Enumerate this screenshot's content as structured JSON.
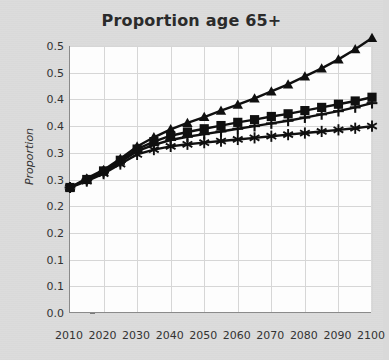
{
  "chart_data": {
    "type": "line",
    "title": "Proportion age 65+",
    "xlabel": "",
    "ylabel": "Proportion",
    "xlim": [
      2010,
      2100
    ],
    "ylim": [
      0.0,
      0.5
    ],
    "grid": true,
    "legend": "none",
    "x": [
      2010,
      2015,
      2020,
      2025,
      2030,
      2035,
      2040,
      2045,
      2050,
      2055,
      2060,
      2065,
      2070,
      2075,
      2080,
      2085,
      2090,
      2095,
      2100
    ],
    "x_tick_labels": [
      "2010",
      "2020",
      "2030",
      "2040",
      "2050",
      "2060",
      "2070",
      "2080",
      "2090",
      "2100"
    ],
    "x_tick_values": [
      2010,
      2020,
      2030,
      2040,
      2050,
      2060,
      2070,
      2080,
      2090,
      2100
    ],
    "y_tick_labels": [
      "0.5",
      "0.5",
      "0.4",
      "0.4",
      "0.3",
      "0.3",
      "0.2",
      "0.2",
      "0.1",
      "0.1",
      "0.0"
    ],
    "y_tick_values": [
      0.5,
      0.45,
      0.4,
      0.35,
      0.3,
      0.25,
      0.2,
      0.15,
      0.1,
      0.05,
      0.0
    ],
    "series": [
      {
        "name": "series-triangle",
        "marker": "triangle",
        "color": "#101010",
        "values": [
          0.235,
          0.252,
          0.268,
          0.289,
          0.312,
          0.329,
          0.344,
          0.356,
          0.367,
          0.379,
          0.39,
          0.402,
          0.415,
          0.428,
          0.443,
          0.458,
          0.475,
          0.494,
          0.515
        ]
      },
      {
        "name": "series-square",
        "marker": "square",
        "color": "#101010",
        "values": [
          0.235,
          0.25,
          0.266,
          0.286,
          0.307,
          0.321,
          0.332,
          0.339,
          0.345,
          0.351,
          0.357,
          0.362,
          0.368,
          0.373,
          0.379,
          0.385,
          0.391,
          0.397,
          0.404
        ]
      },
      {
        "name": "series-plus",
        "marker": "plus",
        "color": "#101010",
        "values": [
          0.235,
          0.249,
          0.264,
          0.283,
          0.303,
          0.315,
          0.324,
          0.33,
          0.335,
          0.34,
          0.345,
          0.35,
          0.355,
          0.36,
          0.366,
          0.372,
          0.378,
          0.385,
          0.393
        ]
      },
      {
        "name": "series-asterisk",
        "marker": "asterisk",
        "color": "#101010",
        "values": [
          0.235,
          0.247,
          0.261,
          0.279,
          0.297,
          0.306,
          0.312,
          0.316,
          0.319,
          0.322,
          0.325,
          0.328,
          0.331,
          0.334,
          0.337,
          0.34,
          0.343,
          0.346,
          0.35
        ]
      }
    ]
  }
}
